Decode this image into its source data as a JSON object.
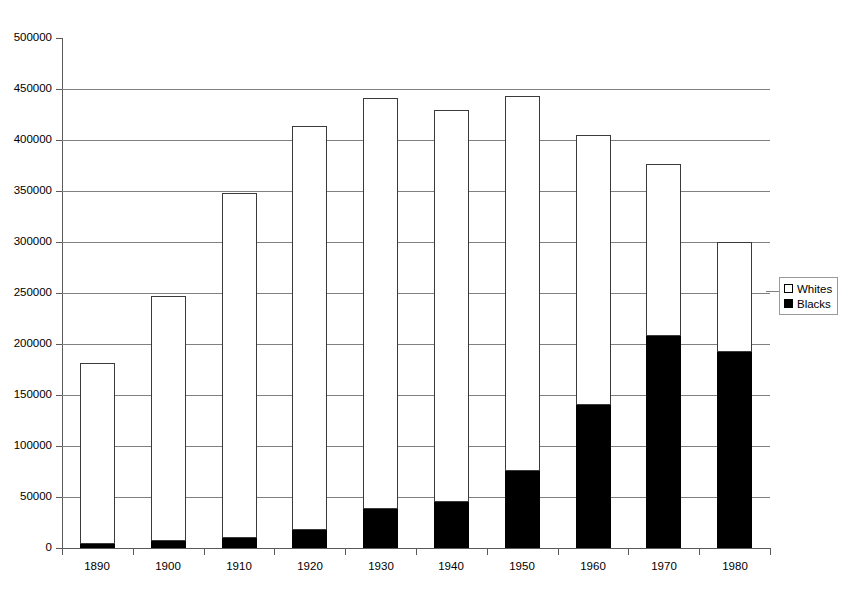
{
  "chart_data": {
    "type": "bar",
    "subtype": "stacked-vertical",
    "title": "",
    "subtitle": "",
    "xlabel": "",
    "ylabel": "",
    "categories": [
      "1890",
      "1900",
      "1910",
      "1920",
      "1930",
      "1940",
      "1950",
      "1960",
      "1970",
      "1980"
    ],
    "series": [
      {
        "name": "Whites",
        "color": "#ffffff",
        "values": [
          177000,
          240000,
          338000,
          396000,
          403000,
          384000,
          368000,
          265000,
          169000,
          108000
        ]
      },
      {
        "name": "Blacks",
        "color": "#000000",
        "values": [
          4000,
          7000,
          10000,
          18000,
          38000,
          45000,
          75000,
          140000,
          208000,
          192000
        ]
      }
    ],
    "totals": [
      181000,
      247000,
      348000,
      414000,
      441000,
      429000,
      443000,
      405000,
      377000,
      300000
    ],
    "ylim": [
      0,
      500000
    ],
    "ytick_values": [
      0,
      50000,
      100000,
      150000,
      200000,
      250000,
      300000,
      350000,
      400000,
      450000,
      500000
    ],
    "ytick_labels": [
      "0",
      "50000",
      "100000",
      "150000",
      "200000",
      "250000",
      "300000",
      "350000",
      "400000",
      "450000",
      "500000"
    ],
    "grid": true,
    "grid_axis": "y",
    "legend_position": "right",
    "legend_entries": [
      {
        "label": "Whites",
        "swatch": "white-square-outline"
      },
      {
        "label": "Blacks",
        "swatch": "black-filled-square"
      }
    ]
  }
}
